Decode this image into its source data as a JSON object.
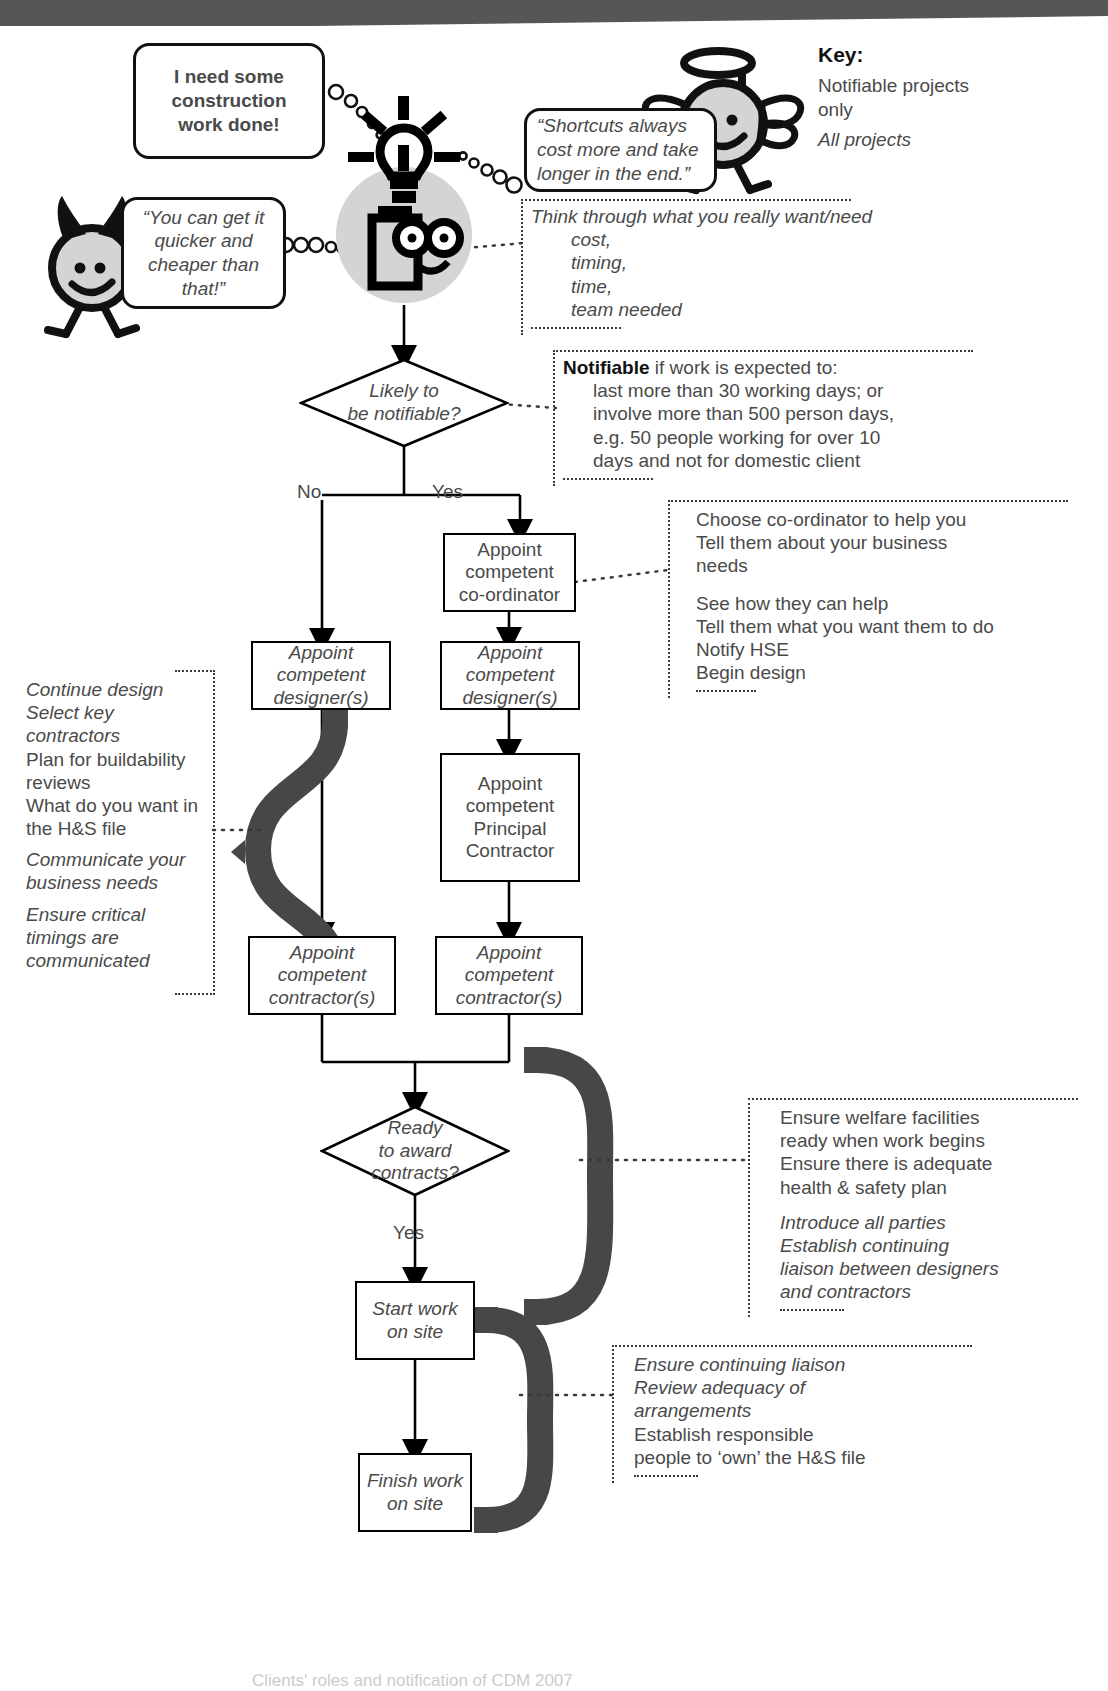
{
  "key": {
    "title": "Key:",
    "notifiable_label": "Notifiable projects\nonly",
    "all_label": "All projects"
  },
  "bubbles": {
    "client": "I need some\nconstruction\nwork done!",
    "devil": "“You can get it\nquicker and\ncheaper than\nthat!”",
    "angel": "“Shortcuts always\ncost more and take\nlonger in the end.”"
  },
  "annotations": {
    "think": {
      "lines": [
        {
          "text": "Think through what you really want/need",
          "italic": true,
          "indent": 0
        },
        {
          "text": "cost,",
          "italic": true,
          "indent": 40
        },
        {
          "text": "timing,",
          "italic": true,
          "indent": 40
        },
        {
          "text": "time,",
          "italic": true,
          "indent": 40
        },
        {
          "text": "team needed",
          "italic": true,
          "indent": 40
        }
      ]
    },
    "notifiable": {
      "bold_lead": "Notifiable",
      "lead_rest": " if work is expected to:",
      "lines": [
        {
          "text": "last more than 30 working days; or",
          "italic": false,
          "indent": 30
        },
        {
          "text": "involve more than 500 person days,",
          "italic": false,
          "indent": 30
        },
        {
          "text": "e.g. 50 people working for over 10",
          "italic": false,
          "indent": 30
        },
        {
          "text": "days and not for domestic client",
          "italic": false,
          "indent": 30
        }
      ]
    },
    "coordinator": {
      "group_a": [
        {
          "text": "Choose co-ordinator to help you",
          "italic": false
        },
        {
          "text": "Tell them about your business",
          "italic": false
        },
        {
          "text": "needs",
          "italic": false
        }
      ],
      "group_b": [
        {
          "text": "See how they can help",
          "italic": false
        },
        {
          "text": "Tell them what you want them to do",
          "italic": false
        },
        {
          "text": "Notify HSE",
          "italic": false
        },
        {
          "text": "Begin design",
          "italic": false
        }
      ]
    },
    "designer_left": {
      "lines": [
        {
          "text": "Continue design",
          "italic": true
        },
        {
          "text": "Select key",
          "italic": true
        },
        {
          "text": "contractors",
          "italic": true
        },
        {
          "text": "Plan for buildability",
          "italic": false
        },
        {
          "text": "reviews",
          "italic": false
        },
        {
          "text": "What do you want in",
          "italic": false
        },
        {
          "text": "the H&S file",
          "italic": false
        },
        {
          "text": "Communicate your",
          "italic": true
        },
        {
          "text": "business needs",
          "italic": true
        },
        {
          "text": "Ensure critical",
          "italic": true
        },
        {
          "text": "timings are",
          "italic": true
        },
        {
          "text": "communicated",
          "italic": true
        }
      ]
    },
    "welfare": {
      "group_a": [
        {
          "text": "Ensure welfare facilities",
          "italic": false
        },
        {
          "text": "ready when work begins",
          "italic": false
        },
        {
          "text": "Ensure there is adequate",
          "italic": false
        },
        {
          "text": "health & safety plan",
          "italic": false
        }
      ],
      "group_b": [
        {
          "text": "Introduce all parties",
          "italic": true
        },
        {
          "text": "Establish continuing",
          "italic": true
        },
        {
          "text": "liaison between designers",
          "italic": true
        },
        {
          "text": "and contractors",
          "italic": true
        }
      ]
    },
    "liaison": {
      "lines": [
        {
          "text": "Ensure continuing liaison",
          "italic": true
        },
        {
          "text": "Review adequacy of",
          "italic": true
        },
        {
          "text": "arrangements",
          "italic": true
        },
        {
          "text": "Establish responsible",
          "italic": false
        },
        {
          "text": "people to ‘own’ the H&S file",
          "italic": false
        }
      ]
    }
  },
  "flow": {
    "decision_notifiable": "Likely to\nbe notifiable?",
    "label_no": "No",
    "label_yes": "Yes",
    "box_coordinator": "Appoint\ncompetent\nco-ordinator",
    "box_designer_left": "Appoint\ncompetent\ndesigner(s)",
    "box_designer_right": "Appoint\ncompetent\ndesigner(s)",
    "box_principal_contractor": "Appoint\ncompetent\nPrincipal\nContractor",
    "box_contractor_left": "Appoint\ncompetent\ncontractor(s)",
    "box_contractor_right": "Appoint\ncompetent\ncontractor(s)",
    "decision_award": "Ready\nto award\ncontracts?",
    "label_yes2": "Yes",
    "box_start_work": "Start work\non site",
    "box_finish_work": "Finish work\non site"
  },
  "caption": "Clients' roles and notification of CDM 2007",
  "colors": {
    "brace": "#474747",
    "header_bar": "#565656",
    "text": "#4a4a4a",
    "ink": "#111111"
  }
}
